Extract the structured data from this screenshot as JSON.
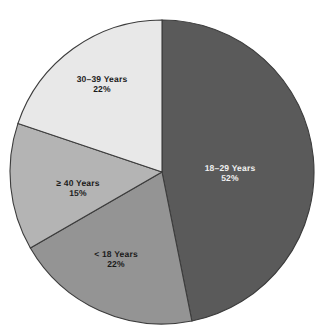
{
  "chart_data": {
    "type": "pie",
    "title": "",
    "subtitle": "",
    "xlabel": "",
    "ylabel": "",
    "legend": "none",
    "grid": false,
    "start_angle_deg": 0,
    "direction": "clockwise",
    "categories": [
      "18–29 Years",
      "< 18 Years",
      "≥ 40 Years",
      "30–39 Years"
    ],
    "values": [
      52,
      22,
      15,
      22
    ],
    "value_suffix": "%",
    "colors": [
      "#5a5a5a",
      "#949494",
      "#b4b4b4",
      "#e8e8e8"
    ],
    "slices": [
      {
        "label": "18–29 Years",
        "percent_text": "52%",
        "value": 52,
        "color": "#5a5a5a",
        "label_color": "light",
        "label_x": 230,
        "label_y": 173
      },
      {
        "label": "< 18 Years",
        "percent_text": "22%",
        "value": 22,
        "color": "#949494",
        "label_color": "dark",
        "label_x": 116,
        "label_y": 259
      },
      {
        "label": "≥ 40 Years",
        "percent_text": "15%",
        "value": 15,
        "color": "#b4b4b4",
        "label_color": "dark",
        "label_x": 78,
        "label_y": 188
      },
      {
        "label": "30–39 Years",
        "percent_text": "22%",
        "value": 22,
        "color": "#e8e8e8",
        "label_color": "dark",
        "label_x": 102,
        "label_y": 84
      }
    ],
    "geometry": {
      "center_x": 162,
      "center_y": 172,
      "radius": 152
    }
  }
}
